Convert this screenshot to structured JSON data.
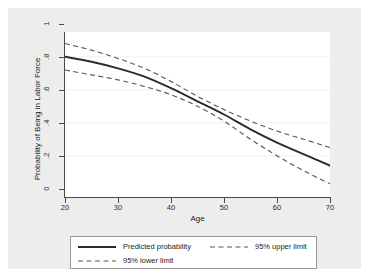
{
  "chart_data": {
    "type": "line",
    "title": "",
    "xlabel": "Age",
    "ylabel": "Probability of Being in Labor Force",
    "xlim": [
      20,
      70
    ],
    "ylim": [
      0,
      1
    ],
    "xticks": [
      "20",
      "30",
      "40",
      "50",
      "60",
      "70"
    ],
    "yticks": [
      "0",
      ".2",
      ".4",
      ".6",
      ".8",
      "1"
    ],
    "grid": "horizontal-faint",
    "legend_position": "below-plot",
    "x": [
      20,
      25,
      30,
      35,
      40,
      45,
      50,
      55,
      60,
      65,
      70
    ],
    "series": [
      {
        "name": "Predicted probability",
        "style": "solid",
        "color": "#2b2b2b",
        "values": [
          0.85,
          0.82,
          0.78,
          0.73,
          0.66,
          0.58,
          0.5,
          0.41,
          0.33,
          0.26,
          0.19
        ]
      },
      {
        "name": "95% upper limit",
        "style": "dashed",
        "color": "#555555",
        "values": [
          0.93,
          0.89,
          0.84,
          0.78,
          0.7,
          0.61,
          0.53,
          0.46,
          0.4,
          0.35,
          0.3
        ]
      },
      {
        "name": "95% lower limit",
        "style": "dashed",
        "color": "#555555",
        "values": [
          0.77,
          0.74,
          0.71,
          0.67,
          0.62,
          0.55,
          0.46,
          0.35,
          0.25,
          0.16,
          0.08
        ]
      }
    ]
  },
  "axes": {
    "x_title": "Age",
    "y_title": "Probability of Being in Labor Force",
    "x_ticks": [
      "20",
      "30",
      "40",
      "50",
      "60",
      "70"
    ],
    "y_ticks": [
      "1",
      ".8",
      ".6",
      ".4",
      ".2",
      "0"
    ]
  },
  "legend": {
    "items": [
      {
        "label": "Predicted probability",
        "style": "solid"
      },
      {
        "label": "95% upper limit",
        "style": "dashed"
      },
      {
        "label": "95% lower limit",
        "style": "dashed"
      }
    ]
  },
  "colors": {
    "graph_region": "#ededed",
    "plot_background": "#ffffff",
    "axis": "#4a4a4a",
    "main_line": "#2b2b2b",
    "ci_line": "#555555",
    "legend_border": "#9a9a9a"
  }
}
